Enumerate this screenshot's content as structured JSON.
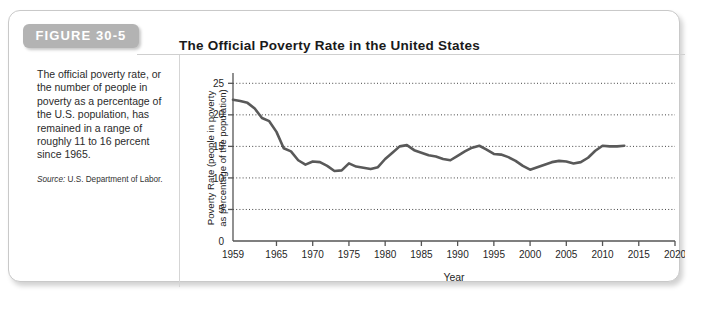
{
  "figure": {
    "label": "FIGURE 30-5",
    "title": "The Official Poverty Rate in the United States",
    "caption": "The official poverty rate, or the number of people in poverty as a percentage of the U.S. population, has remained in a range of roughly 11 to 16 percent since 1965.",
    "source_label": "Source:",
    "source_text": " U.S. Department of Labor.",
    "colors": {
      "chip_background": "#b3b3b3",
      "chip_text": "#ffffff",
      "line": "#595959",
      "gridline": "#444444",
      "axis": "#555555",
      "card_border": "#c9c9c9",
      "background": "#ffffff"
    }
  },
  "chart_data": {
    "type": "line",
    "title": "The Official Poverty Rate in the United States",
    "xlabel": "Year",
    "ylabel": "Poverty Rate (people in poverty as percentage of the population)",
    "ylabel_line1": "Poverty Rate (people in poverty",
    "ylabel_line2": "as percentage of the population)",
    "xlim": [
      1959,
      2020
    ],
    "ylim": [
      0,
      26
    ],
    "xticks": [
      1959,
      1965,
      1970,
      1975,
      1980,
      1985,
      1990,
      1995,
      2000,
      2005,
      2010,
      2015,
      2020
    ],
    "xtick_labels": [
      "1959",
      "1965",
      "1970",
      "1975",
      "1980",
      "1985",
      "1990",
      "1995",
      "2000",
      "2005",
      "2010",
      "2015",
      "2020"
    ],
    "yticks": [
      0,
      5,
      10,
      15,
      20,
      25
    ],
    "ytick_labels": [
      "0",
      "5",
      "10",
      "15",
      "20",
      "25"
    ],
    "grid": "horizontal-dotted",
    "legend": "none",
    "series": [
      {
        "name": "Official poverty rate",
        "x": [
          1959,
          1960,
          1961,
          1962,
          1963,
          1964,
          1965,
          1966,
          1967,
          1968,
          1969,
          1970,
          1971,
          1972,
          1973,
          1974,
          1975,
          1976,
          1977,
          1978,
          1979,
          1980,
          1981,
          1982,
          1983,
          1984,
          1985,
          1986,
          1987,
          1988,
          1989,
          1990,
          1991,
          1992,
          1993,
          1994,
          1995,
          1996,
          1997,
          1998,
          1999,
          2000,
          2001,
          2002,
          2003,
          2004,
          2005,
          2006,
          2007,
          2008,
          2009,
          2010,
          2011,
          2012,
          2013
        ],
        "values": [
          22.4,
          22.2,
          21.9,
          21.0,
          19.5,
          19.0,
          17.3,
          14.7,
          14.2,
          12.8,
          12.1,
          12.6,
          12.5,
          11.9,
          11.1,
          11.2,
          12.3,
          11.8,
          11.6,
          11.4,
          11.7,
          13.0,
          14.0,
          15.0,
          15.2,
          14.4,
          14.0,
          13.6,
          13.4,
          13.0,
          12.8,
          13.5,
          14.2,
          14.8,
          15.1,
          14.5,
          13.8,
          13.7,
          13.3,
          12.7,
          11.9,
          11.3,
          11.7,
          12.1,
          12.5,
          12.7,
          12.6,
          12.3,
          12.5,
          13.2,
          14.3,
          15.1,
          15.0,
          15.0,
          15.1
        ]
      }
    ]
  }
}
